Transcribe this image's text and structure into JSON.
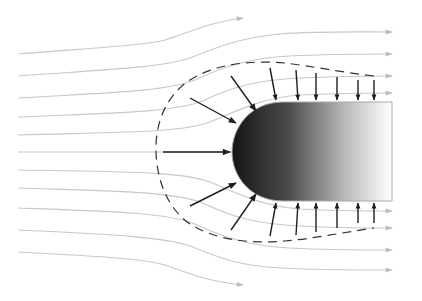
{
  "diagram": {
    "type": "flow-around-blunt-body",
    "colors": {
      "background": "#ffffff",
      "streamline": "#c8c8c8",
      "streamline_arrowhead": "#bdbdbd",
      "pressure_arrow": "#1e1e1e",
      "boundary_dash": "#333333",
      "body_gradient_start": "#1a1a1a",
      "body_gradient_end": "#ffffff",
      "body_outline": "#aaaaaa"
    },
    "body": {
      "nose_x": 232,
      "top_y": 102,
      "bottom_y": 201,
      "right_x": 392
    },
    "streamline_count": 11,
    "pressure_arrow_count": 17,
    "labels": []
  }
}
